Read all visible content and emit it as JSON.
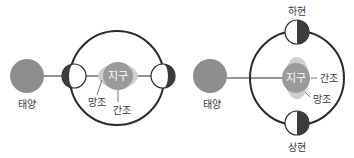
{
  "colors": {
    "sun": "#8e8e8e",
    "earth": "#9a9a9a",
    "earth_halo": "#c9c9c9",
    "orbit": "#2a2a2a",
    "moon_dark": "#3c3c3c",
    "moon_light": "#ffffff",
    "text": "#3a3a3a"
  },
  "left_diagram": {
    "sun_label": "태양",
    "earth_label": "지구",
    "spring_tide_label": "망조",
    "neap_tide_label": "간조"
  },
  "right_diagram": {
    "sun_label": "태양",
    "earth_label": "지구",
    "neap_tide_label": "간조",
    "spring_tide_label": "망조",
    "top_moon_label": "하현",
    "bottom_moon_label": "상현"
  }
}
